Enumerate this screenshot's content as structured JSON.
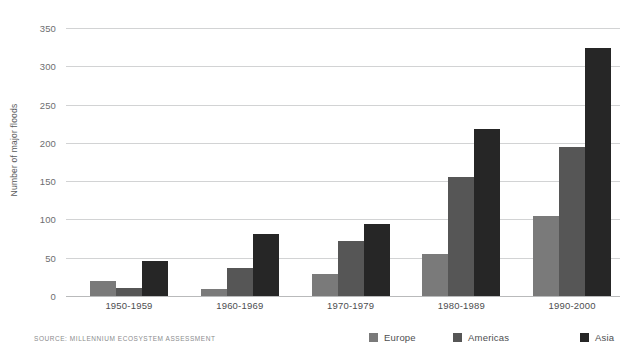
{
  "chart_data": {
    "type": "bar",
    "title": "",
    "subtitle": "",
    "xlabel": "",
    "ylabel": "Number of major floods",
    "categories": [
      "1950-1959",
      "1960-1969",
      "1970-1979",
      "1980-1989",
      "1990-2000"
    ],
    "series": [
      {
        "name": "Europe",
        "color": "#7a7a7a",
        "values": [
          20,
          9,
          29,
          55,
          105
        ]
      },
      {
        "name": "Americas",
        "color": "#565656",
        "values": [
          11,
          37,
          72,
          155,
          194
        ]
      },
      {
        "name": "Asia",
        "color": "#262626",
        "values": [
          46,
          81,
          94,
          218,
          324
        ]
      }
    ],
    "ylim": [
      0,
      350
    ],
    "yticks": [
      0,
      50,
      100,
      150,
      200,
      250,
      300,
      350
    ],
    "ytick_labels": [
      "0",
      "50",
      "100",
      "150",
      "200",
      "250",
      "300",
      "350"
    ],
    "grid": true,
    "grid_color": "#d2d3d4",
    "legend_position": "bottom-right",
    "background": "#ffffff"
  },
  "footer": {
    "source_note": "SOURCE: MILLENNIUM ECOSYSTEM ASSESSMENT"
  }
}
